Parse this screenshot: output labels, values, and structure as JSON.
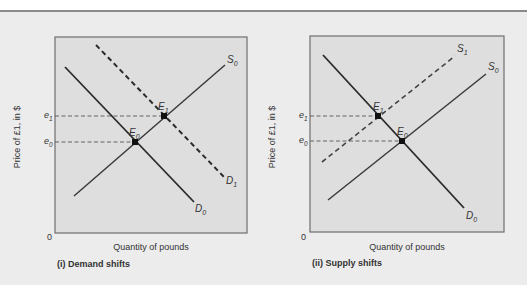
{
  "colors": {
    "background": "#ececec",
    "panel_fill": "#dedede",
    "panel_border": "#6e6e6e",
    "line": "#2a2a2a",
    "guide": "#555555",
    "text": "#333333"
  },
  "panels": [
    {
      "id": "demand",
      "caption": "(i) Demand shifts",
      "xlabel": "Quantity of pounds",
      "ylabel": "Price of £1, in $",
      "origin": "0",
      "price_labels": [
        {
          "base": "e",
          "sub": "1"
        },
        {
          "base": "e",
          "sub": "0"
        }
      ],
      "curves": [
        {
          "name": "S",
          "sub": "0",
          "style": "solid"
        },
        {
          "name": "D",
          "sub": "0",
          "style": "solid"
        },
        {
          "name": "D",
          "sub": "1",
          "style": "dashed"
        }
      ],
      "points": [
        {
          "base": "E",
          "sub": "0"
        },
        {
          "base": "E",
          "sub": "1"
        }
      ]
    },
    {
      "id": "supply",
      "caption": "(ii) Supply shifts",
      "xlabel": "Quantity of pounds",
      "ylabel": "Price of £1, in $",
      "origin": "0",
      "price_labels": [
        {
          "base": "e",
          "sub": "1"
        },
        {
          "base": "e",
          "sub": "0"
        }
      ],
      "curves": [
        {
          "name": "S",
          "sub": "0",
          "style": "solid"
        },
        {
          "name": "S",
          "sub": "1",
          "style": "dashed"
        },
        {
          "name": "D",
          "sub": "0",
          "style": "solid"
        }
      ],
      "points": [
        {
          "base": "E",
          "sub": "0"
        },
        {
          "base": "E",
          "sub": "1"
        }
      ]
    }
  ]
}
